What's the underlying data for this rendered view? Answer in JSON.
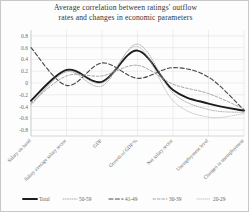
{
  "chart_data": {
    "type": "line",
    "title_line_1": "Average correlation between ratings' outflow",
    "title_line_2": "rates and changes  in economic parameters",
    "title": "Average correlation between ratings' outflow rates and changes in economic parameters",
    "xlabel": "",
    "ylabel": "",
    "ylim": [
      -0.9,
      0.9
    ],
    "yticks": [
      0.8,
      0.6,
      0.4,
      0.2,
      0,
      -0.2,
      -0.4,
      -0.6,
      -0.8
    ],
    "ytick_labels": [
      "0.8",
      "0.6",
      "0.4",
      "0.2",
      "0",
      "-0.2",
      "-0.4",
      "-0.6",
      "-0.8"
    ],
    "grid": true,
    "legend_position": "bottom",
    "categories": [
      "Salary on hand",
      "Salary average salary sector",
      "GDP",
      "Growth of GDP %",
      "Net salary sector",
      "Unemployment level",
      "Changes in unemployment"
    ],
    "series": [
      {
        "name": "Total",
        "style": "solid-thick",
        "color": "#1c1c1c",
        "width": 1.9,
        "dash": "none",
        "values": [
          -0.3,
          0.22,
          0.02,
          0.55,
          -0.12,
          -0.35,
          -0.47
        ]
      },
      {
        "name": "50-59",
        "style": "dotted-thin",
        "color": "#9a9a9a",
        "width": 0.75,
        "dash": "1,1.3",
        "values": [
          -0.36,
          0.19,
          -0.05,
          0.66,
          -0.17,
          -0.45,
          -0.5
        ]
      },
      {
        "name": "41-49",
        "style": "dashed-bold",
        "color": "#4a4a4a",
        "width": 1.15,
        "dash": "4,2.4",
        "values": [
          0.6,
          -0.04,
          0.34,
          0.08,
          0.26,
          0.1,
          -0.46
        ]
      },
      {
        "name": "30-39",
        "style": "dashed-thin",
        "color": "#8e8e8e",
        "width": 0.8,
        "dash": "2.6,1.8",
        "values": [
          -0.34,
          0.12,
          0.12,
          0.3,
          -0.02,
          -0.18,
          -0.44
        ]
      },
      {
        "name": "20-29",
        "style": "dotted-faint",
        "color": "#b0b0b0",
        "width": 0.7,
        "dash": "0.8,1.2",
        "values": [
          -0.38,
          0.2,
          0.0,
          0.62,
          -0.3,
          -0.58,
          -0.52
        ]
      }
    ]
  },
  "legend": {
    "items": [
      {
        "label": "Total"
      },
      {
        "label": "50-59"
      },
      {
        "label": "41-49"
      },
      {
        "label": "30-39"
      },
      {
        "label": "20-29"
      }
    ]
  }
}
